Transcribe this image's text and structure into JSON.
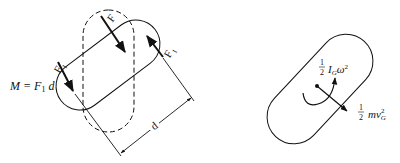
{
  "left_figure": {
    "moment_label": "M = F",
    "moment_sub": "1",
    "moment_tail": " d",
    "force_F": "F",
    "force_F1_left": "F",
    "force_F1_left_sub": "1",
    "force_F1_right": "F",
    "force_F1_right_sub": "1",
    "dimension_label": "d"
  },
  "right_figure": {
    "rot_energy_frac_num": "1",
    "rot_energy_frac_den": "2",
    "rot_energy_term": "I",
    "rot_energy_sub": "G",
    "rot_energy_omega": "ω",
    "rot_energy_exp": "2",
    "trans_energy_frac_num": "1",
    "trans_energy_frac_den": "2",
    "trans_energy_term": "mv",
    "trans_energy_sub": "G",
    "trans_energy_exp": "2"
  },
  "colors": {
    "stroke": "#111111",
    "background": "#ffffff"
  }
}
